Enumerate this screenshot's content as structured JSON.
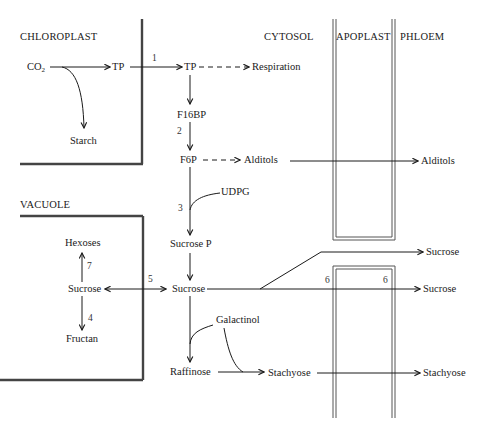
{
  "regions": {
    "chloroplast": "CHLOROPLAST",
    "cytosol": "CYTOSOL",
    "apoplast": "APOPLAST",
    "phloem": "PHLOEM",
    "vacuole": "VACUOLE"
  },
  "metabolites": {
    "co2": "CO",
    "co2_sub": "2",
    "tp_chloroplast": "TP",
    "starch": "Starch",
    "tp_cytosol": "TP",
    "respiration": "Respiration",
    "f16bp": "F16BP",
    "f6p": "F6P",
    "alditols_cytosol": "Alditols",
    "alditols_phloem": "Alditols",
    "udpg": "UDPG",
    "sucrose_p": "Sucrose P",
    "sucrose_cytosol": "Sucrose",
    "sucrose_vacuole": "Sucrose",
    "hexoses": "Hexoses",
    "fructan": "Fructan",
    "galactinol": "Galactinol",
    "raffinose": "Raffinose",
    "stachyose_cytosol": "Stachyose",
    "stachyose_phloem": "Stachyose",
    "sucrose_phloem_upper": "Sucrose",
    "sucrose_phloem_lower": "Sucrose"
  },
  "step_numbers": {
    "step1": "1",
    "step2": "2",
    "step3": "3",
    "step4": "4",
    "step5": "5",
    "step6_left": "6",
    "step6_right": "6",
    "step7": "7"
  },
  "colors": {
    "line": "#1a1a1a",
    "wall": "#444444",
    "background": "#ffffff"
  }
}
